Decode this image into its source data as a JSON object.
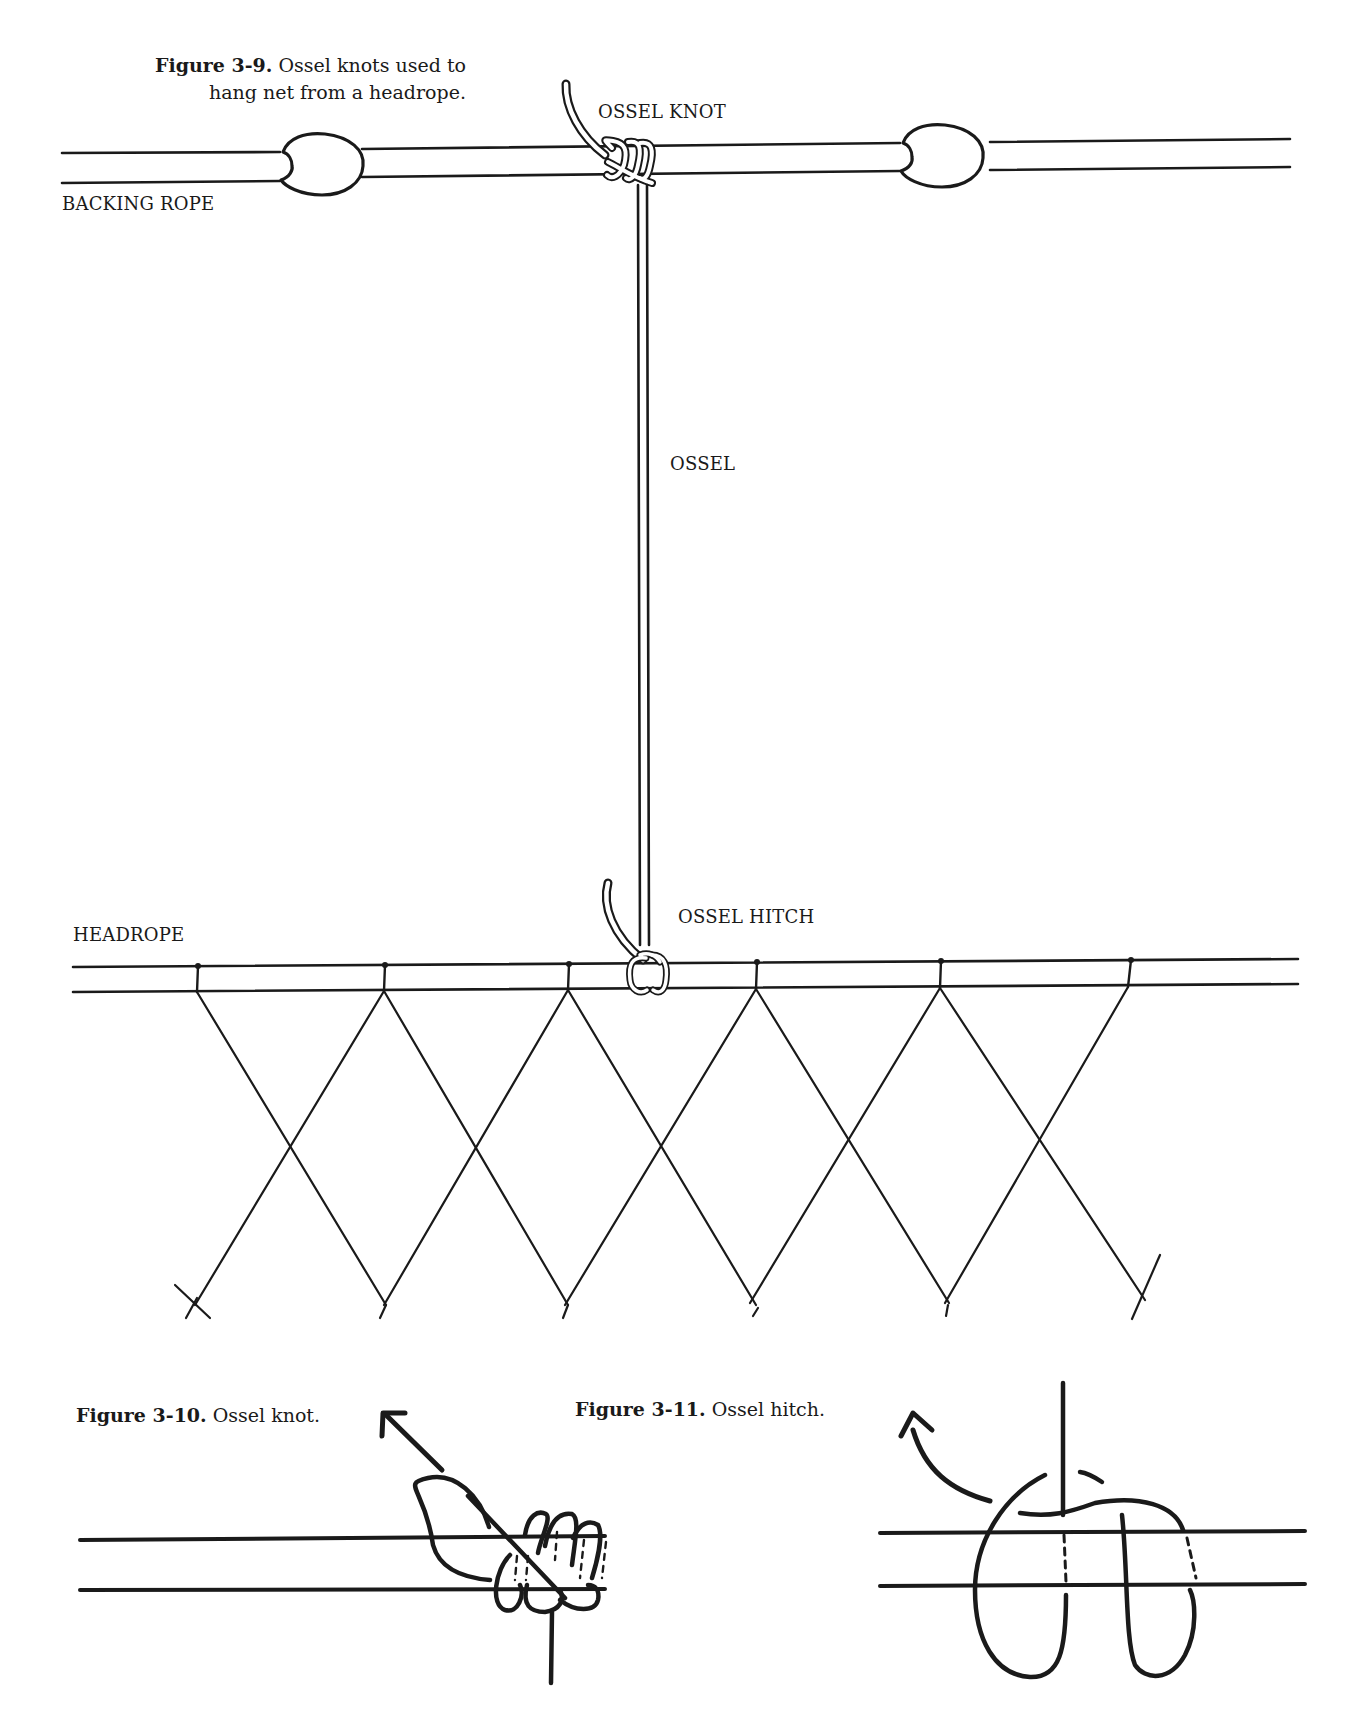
{
  "figures": {
    "fig_3_9": {
      "number": "Figure 3-9.",
      "caption_line1": "Ossel knots used to",
      "caption_line2": "hang net from a headrope.",
      "labels": {
        "ossel_knot": "OSSEL KNOT",
        "backing_rope": "BACKING ROPE",
        "ossel": "OSSEL",
        "ossel_hitch": "OSSEL HITCH",
        "headrope": "HEADROPE"
      },
      "floats_count": 2,
      "net_hanging_points": 6
    },
    "fig_3_10": {
      "number": "Figure 3-10.",
      "caption": "Ossel knot."
    },
    "fig_3_11": {
      "number": "Figure 3-11.",
      "caption": "Ossel hitch."
    }
  },
  "colors": {
    "ink": "#1a1a1a",
    "paper": "#ffffff"
  }
}
